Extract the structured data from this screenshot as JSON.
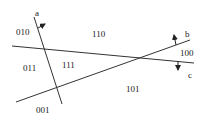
{
  "diagram": {
    "lines": [
      {
        "name": "a",
        "label": "a",
        "x1": 34,
        "y1": 17,
        "x2": 62,
        "y2": 104
      },
      {
        "name": "b",
        "label": "b",
        "x1": 16,
        "y1": 102,
        "x2": 190,
        "y2": 40
      },
      {
        "name": "c",
        "label": "c",
        "x1": 12,
        "y1": 46,
        "x2": 194,
        "y2": 63
      }
    ],
    "line_labels": {
      "a": "a",
      "b": "b",
      "c": "c"
    },
    "regions": {
      "r010": "010",
      "r110": "110",
      "r100": "100",
      "r011": "011",
      "r111": "111",
      "r101": "101",
      "r001": "001"
    },
    "colors": {
      "stroke": "#333333",
      "text": "#222222",
      "background": "#ffffff"
    }
  }
}
